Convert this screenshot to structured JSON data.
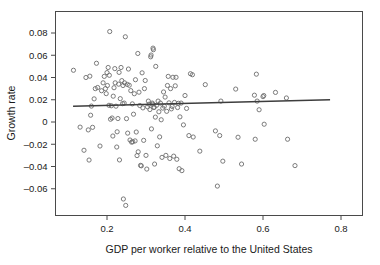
{
  "chart_data": {
    "type": "scatter",
    "title": "",
    "xlabel": "GDP per worker relative to the United States",
    "ylabel": "Growth rate",
    "xlim": [
      0.1,
      0.83
    ],
    "ylim": [
      -0.076,
      0.09
    ],
    "grid": false,
    "legend": null,
    "xticks": [
      0.2,
      0.4,
      0.6,
      0.8
    ],
    "xtick_labels": [
      "0.2",
      "0.4",
      "0.6",
      "0.8"
    ],
    "yticks": [
      0.08,
      0.06,
      0.04,
      0.02,
      0,
      -0.02,
      -0.04,
      -0.06
    ],
    "ytick_labels": [
      "0.08",
      "0.06",
      "0.04",
      "0.02",
      "0",
      "–0.02",
      "–0.04",
      "–0.06"
    ],
    "marker": {
      "shape": "open-circle",
      "radius": 2.1,
      "stroke": "#6d6d6d",
      "fill": "none"
    },
    "fit_line": {
      "name": "regression-line",
      "color": "#3d3d3d",
      "width": 1.4,
      "x_start": 0.113,
      "y_start": 0.0142,
      "x_end": 0.772,
      "y_end": 0.02
    },
    "points": [
      [
        0.114,
        0.0465
      ],
      [
        0.131,
        -0.0046
      ],
      [
        0.141,
        -0.0254
      ],
      [
        0.146,
        0.04
      ],
      [
        0.152,
        -0.0071
      ],
      [
        0.154,
        -0.0342
      ],
      [
        0.156,
        0.0412
      ],
      [
        0.158,
        0.0061
      ],
      [
        0.16,
        0.0143
      ],
      [
        0.163,
        -0.0048
      ],
      [
        0.167,
        0.0208
      ],
      [
        0.17,
        0.03
      ],
      [
        0.173,
        0.0528
      ],
      [
        0.176,
        0.031
      ],
      [
        0.182,
        -0.0216
      ],
      [
        0.186,
        0.0281
      ],
      [
        0.19,
        0.0352
      ],
      [
        0.193,
        0.041
      ],
      [
        0.196,
        0.03
      ],
      [
        0.198,
        0.0255
      ],
      [
        0.2,
        0.0444
      ],
      [
        0.201,
        0.0328
      ],
      [
        0.203,
        0.049
      ],
      [
        0.205,
        0.015
      ],
      [
        0.206,
        0.042
      ],
      [
        0.207,
        0.0813
      ],
      [
        0.209,
        0.0025
      ],
      [
        0.211,
        0.0146
      ],
      [
        0.213,
        0.0036
      ],
      [
        0.215,
        -0.0126
      ],
      [
        0.216,
        0.0232
      ],
      [
        0.218,
        0.0308
      ],
      [
        0.22,
        0.048
      ],
      [
        0.221,
        0.0352
      ],
      [
        0.223,
        0.0142
      ],
      [
        0.225,
        -0.0225
      ],
      [
        0.226,
        -0.0088
      ],
      [
        0.228,
        0.0031
      ],
      [
        0.23,
        0.034
      ],
      [
        0.231,
        0.0446
      ],
      [
        0.232,
        -0.0341
      ],
      [
        0.234,
        0.021
      ],
      [
        0.236,
        0.049
      ],
      [
        0.238,
        0.0372
      ],
      [
        0.24,
        0.0165
      ],
      [
        0.241,
        0.0328
      ],
      [
        0.242,
        -0.0692
      ],
      [
        0.244,
        0.017
      ],
      [
        0.245,
        0.0352
      ],
      [
        0.247,
        0.0766
      ],
      [
        0.248,
        -0.075
      ],
      [
        0.25,
        0.003
      ],
      [
        0.252,
        0.0338
      ],
      [
        0.253,
        -0.01
      ],
      [
        0.255,
        0.0476
      ],
      [
        0.257,
        0.033
      ],
      [
        0.259,
        -0.0162
      ],
      [
        0.261,
        0.0282
      ],
      [
        0.263,
        -0.0181
      ],
      [
        0.265,
        0.0163
      ],
      [
        0.266,
        -0.0178
      ],
      [
        0.268,
        0.007
      ],
      [
        0.27,
        0.0254
      ],
      [
        0.272,
        -0.017
      ],
      [
        0.273,
        0.038
      ],
      [
        0.275,
        -0.009
      ],
      [
        0.277,
        -0.0302
      ],
      [
        0.279,
        0.0616
      ],
      [
        0.28,
        -0.0268
      ],
      [
        0.282,
        0.0268
      ],
      [
        0.284,
        0.0148
      ],
      [
        0.286,
        -0.039
      ],
      [
        0.288,
        -0.0394
      ],
      [
        0.29,
        0.0442
      ],
      [
        0.292,
        0.0127
      ],
      [
        0.294,
        -0.0165
      ],
      [
        0.296,
        0.03
      ],
      [
        0.298,
        0.0373
      ],
      [
        0.3,
        -0.03
      ],
      [
        0.302,
        -0.0423
      ],
      [
        0.304,
        0.0136
      ],
      [
        0.306,
        0.0188
      ],
      [
        0.308,
        0.016
      ],
      [
        0.31,
        0.0112
      ],
      [
        0.312,
        0.0586
      ],
      [
        0.313,
        0.0602
      ],
      [
        0.314,
        -0.0062
      ],
      [
        0.316,
        0.017
      ],
      [
        0.317,
        0.016
      ],
      [
        0.318,
        0.0664
      ],
      [
        0.319,
        0.065
      ],
      [
        0.32,
        0.013
      ],
      [
        0.321,
        0.0133
      ],
      [
        0.322,
        -0.0378
      ],
      [
        0.324,
        0.0044
      ],
      [
        0.325,
        0.05
      ],
      [
        0.327,
        0.015
      ],
      [
        0.329,
        -0.0214
      ],
      [
        0.331,
        0.0188
      ],
      [
        0.333,
        0.0092
      ],
      [
        0.335,
        -0.0134
      ],
      [
        0.337,
        0.017
      ],
      [
        0.339,
        0.002
      ],
      [
        0.341,
        -0.0318
      ],
      [
        0.343,
        0.0125
      ],
      [
        0.345,
        0.027
      ],
      [
        0.347,
        0.0142
      ],
      [
        0.349,
        0.0224
      ],
      [
        0.351,
        -0.03
      ],
      [
        0.353,
        0.0096
      ],
      [
        0.355,
        0.0328
      ],
      [
        0.357,
        0.041
      ],
      [
        0.359,
        0.0172
      ],
      [
        0.361,
        -0.0328
      ],
      [
        0.363,
        0.03
      ],
      [
        0.365,
        0.0118
      ],
      [
        0.367,
        0.014
      ],
      [
        0.369,
        0.0402
      ],
      [
        0.371,
        -0.0307
      ],
      [
        0.373,
        0.0176
      ],
      [
        0.375,
        0.0325
      ],
      [
        0.377,
        0.0402
      ],
      [
        0.379,
        -0.0335
      ],
      [
        0.381,
        0.013
      ],
      [
        0.383,
        0.0168
      ],
      [
        0.385,
        -0.042
      ],
      [
        0.387,
        0.0046
      ],
      [
        0.39,
        0.017
      ],
      [
        0.392,
        -0.0437
      ],
      [
        0.396,
        -0.0026
      ],
      [
        0.4,
        0.0238
      ],
      [
        0.404,
        0.0122
      ],
      [
        0.41,
        -0.0122
      ],
      [
        0.414,
        0.0434
      ],
      [
        0.419,
        0.0425
      ],
      [
        0.421,
        -0.0135
      ],
      [
        0.438,
        -0.0262
      ],
      [
        0.452,
        0.0336
      ],
      [
        0.478,
        -0.008
      ],
      [
        0.483,
        -0.0576
      ],
      [
        0.489,
        -0.0122
      ],
      [
        0.492,
        0.0188
      ],
      [
        0.497,
        -0.0352
      ],
      [
        0.53,
        0.0296
      ],
      [
        0.536,
        -0.0137
      ],
      [
        0.545,
        -0.0378
      ],
      [
        0.578,
        0.0241
      ],
      [
        0.58,
        -0.0155
      ],
      [
        0.583,
        0.043
      ],
      [
        0.585,
        0.0188
      ],
      [
        0.59,
        0.011
      ],
      [
        0.6,
        0.0228
      ],
      [
        0.602,
        0.0238
      ],
      [
        0.603,
        -0.002
      ],
      [
        0.632,
        0.0266
      ],
      [
        0.66,
        0.0216
      ],
      [
        0.663,
        -0.0155
      ],
      [
        0.682,
        -0.0392
      ]
    ]
  }
}
